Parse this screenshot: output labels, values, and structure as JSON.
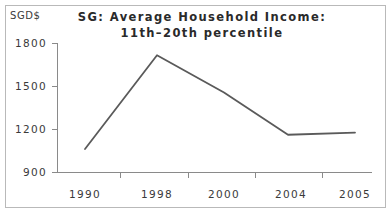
{
  "figure": {
    "unit_label": "SGD$",
    "title_line1": "SG: Average Household Income:",
    "title_line2": "11th–20th percentile",
    "frame_color": "#b9b9b9",
    "line_color": "#5a5a5a",
    "axis_color": "#8a8a8a",
    "text_color": "#3a3a3a"
  },
  "chart_data": {
    "type": "line",
    "title": "SG: Average Household Income: 11th–20th percentile",
    "xlabel": "",
    "ylabel": "SGD$",
    "categories": [
      "1990",
      "1998",
      "2000",
      "2004",
      "2005"
    ],
    "values": [
      1060,
      1715,
      1455,
      1160,
      1175
    ],
    "series": [
      {
        "name": "Average Household Income (11th–20th percentile)",
        "values": [
          1060,
          1715,
          1455,
          1160,
          1175
        ]
      }
    ],
    "ylim": [
      900,
      1800
    ],
    "ytick_labels": [
      "1800",
      "1500",
      "1200",
      "900"
    ],
    "ytick_values": [
      1800,
      1500,
      1200,
      900
    ],
    "xtick_labels": [
      "1990",
      "1998",
      "2000",
      "2004",
      "2005"
    ],
    "grid": false,
    "legend": "none",
    "markers": false
  }
}
